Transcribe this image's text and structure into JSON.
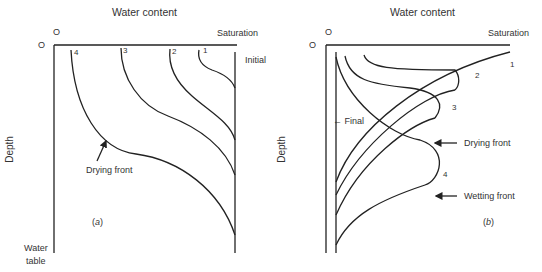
{
  "panel_a": {
    "title": "Water content",
    "origin_x": "O",
    "origin_y": "O",
    "saturation": "Saturation",
    "initial": "Initial",
    "depth": "Depth",
    "water_table_1": "Water",
    "water_table_2": "table",
    "drying_front": "Drying front",
    "tag_open": "(",
    "tag": "a",
    "tag_close": ")",
    "curves": [
      "1",
      "2",
      "3",
      "4"
    ]
  },
  "panel_b": {
    "title": "Water content",
    "origin_x": "O",
    "origin_y": "O",
    "saturation": "Saturation",
    "depth": "Depth",
    "final": "← Final",
    "drying_front": "Drying front",
    "wetting_front": "Wetting front",
    "tag_open": "(",
    "tag": "b",
    "tag_close": ")",
    "curves": [
      "1",
      "2",
      "3",
      "4"
    ]
  }
}
